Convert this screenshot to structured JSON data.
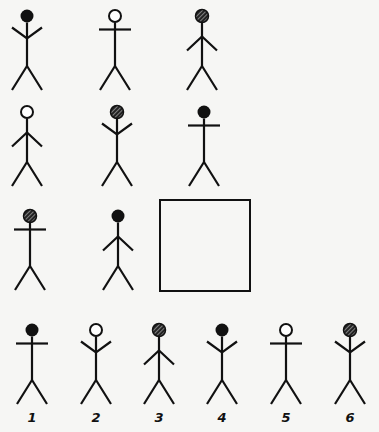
{
  "puzzle": {
    "type": "matrix-completion",
    "colors": {
      "ink": "#111111",
      "background": "#f6f6f4"
    },
    "matrix": [
      [
        {
          "head": "solid",
          "arms": "up"
        },
        {
          "head": "empty",
          "arms": "horizontal"
        },
        {
          "head": "hatched",
          "arms": "down"
        }
      ],
      [
        {
          "head": "empty",
          "arms": "down"
        },
        {
          "head": "hatched",
          "arms": "up"
        },
        {
          "head": "solid",
          "arms": "horizontal"
        }
      ],
      [
        {
          "head": "hatched",
          "arms": "horizontal"
        },
        {
          "head": "solid",
          "arms": "down"
        },
        {
          "head": "missing",
          "arms": "missing"
        }
      ]
    ],
    "options": [
      {
        "label": "1",
        "head": "solid",
        "arms": "horizontal"
      },
      {
        "label": "2",
        "head": "empty",
        "arms": "up"
      },
      {
        "label": "3",
        "head": "hatched",
        "arms": "down"
      },
      {
        "label": "4",
        "head": "solid",
        "arms": "up"
      },
      {
        "label": "5",
        "head": "empty",
        "arms": "horizontal"
      },
      {
        "label": "6",
        "head": "hatched",
        "arms": "up"
      }
    ]
  }
}
